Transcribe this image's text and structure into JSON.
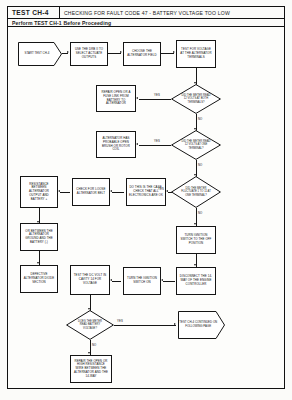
{
  "header": {
    "test_code": "TEST CH-4",
    "title": "CHECKING FOR FAULT CODE 47 - BATTERY VOLTAGE TOO LOW",
    "subtitle": "Perform TEST CH-1 Before Proceeding"
  },
  "nodes": {
    "start": "START TEST CH-4",
    "use_drb": "USE THE DRB II TO SELECT ACTUATE OUTPUTS",
    "choose_field": "CHOOSE THE ALTERNATOR FIELD",
    "test_volt_term": "TEST FOR VOLTAGE AT THE ALTERNATOR TERMINALS",
    "d_read_both": "DID THE METER READ 12 VOLTS AT BOTH TERMINALS?",
    "repair_open": "REPAIR OPEN OR A FUSE LINK FROM BATTERY TO ALTERNATOR",
    "d_read_one": "DID THE METER READ 12 VOLTS AT ONE TERMINAL?",
    "alt_brush": "ALTERNATOR HAS PROBABLE OPEN BRUSH OR ROTOR COIL",
    "d_fluctuate": "DID THE METER FLUCTUATE 1 TO 11 AT ONE TERMINAL?",
    "do_this_check": "DO THIS IS THE CASE, CHECK THAT ALL ELECTRONICS ARE OK",
    "check_belt": "CHECK FOR LOOSE ALTERNATOR BELT",
    "resistance": "RESISTANCE BETWEEN ALTERNATOR OUTPUT AND BATTERY +",
    "between_ground": "OR BETWEEN THE ALTERNATOR GROUND AND THE BATTERY (-)",
    "defective_alt": "DEFECTIVE ALTERNATOR DIODE SECTION",
    "turn_ign_off": "TURN IGNITION SWITCH TO THE OFF POSITION",
    "disconnect_14": "DISCONNECT THE 14-WAY OF THE ENGINE CONTROLLER",
    "turn_ign_on": "TURN THE IGNITION SWITCH ON",
    "test_cav": "TEST THE DC VOLT IN CAVITY 14 FOR VOLTAGE",
    "d_battery_volt": "DOES THE METER READ BATTERY VOLTAGE?",
    "repair_open_14": "REPAIR THE OPEN OR HIGH RESISTANCE WIRE BETWEEN THE ALTERNATOR AND THE 14-WAY",
    "continued": "TEST CH-4 CONTINUED ON FOLLOWING PAGE"
  },
  "edge_labels": {
    "yes_1": "YES",
    "no_1": "NO",
    "yes_2": "YES",
    "no_2": "NO",
    "yes_3": "YES",
    "no_3": "NO",
    "yes_4": "YES",
    "no_4": "NO"
  },
  "colors": {
    "ink": "#161616",
    "paper": "#fdfdfb"
  }
}
